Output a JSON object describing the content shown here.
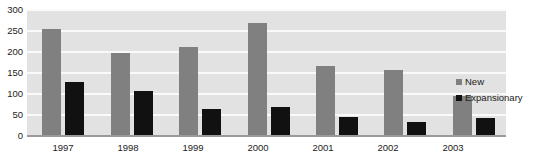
{
  "chart_data": {
    "type": "bar",
    "title": "",
    "xlabel": "",
    "ylabel": "",
    "categories": [
      "1997",
      "1998",
      "1999",
      "2000",
      "2001",
      "2002",
      "2003"
    ],
    "series": [
      {
        "name": "New",
        "color": "#808080",
        "values": [
          252,
          195,
          210,
          267,
          164,
          155,
          94
        ]
      },
      {
        "name": "Expansionary",
        "color": "#111111",
        "values": [
          125,
          105,
          62,
          66,
          44,
          32,
          40
        ]
      }
    ],
    "ylim": [
      0,
      300
    ],
    "yticks": [
      "300",
      "250",
      "200",
      "150",
      "100",
      "50",
      "0"
    ],
    "ytick_values": [
      300,
      250,
      200,
      150,
      100,
      50,
      0
    ],
    "grid": true,
    "legend_position": "right",
    "plot_background": "#e2e2e2",
    "gridline_color": "#fafafa"
  },
  "legend": {
    "items": [
      {
        "label": "New",
        "color": "#808080"
      },
      {
        "label": "Expansionary",
        "color": "#111111"
      }
    ]
  }
}
